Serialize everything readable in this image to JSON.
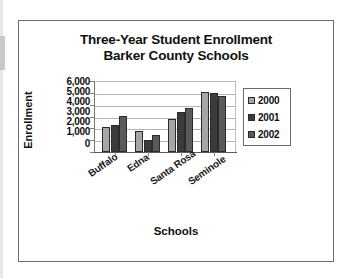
{
  "page": {
    "background": "#ffffff",
    "frame_color": "#6e6e6e"
  },
  "chart_data": {
    "type": "bar",
    "title": "Three-Year Student Enrollment",
    "subtitle": "Barker County Schools",
    "xlabel": "Schools",
    "ylabel": "Enrollment",
    "categories": [
      "Buffalo",
      "Edna",
      "Santa Rosa",
      "Seminole"
    ],
    "series": [
      {
        "name": "2000",
        "color": "#a6a6a6",
        "values": [
          2100,
          1800,
          2800,
          5100
        ]
      },
      {
        "name": "2001",
        "color": "#3b3b3b",
        "values": [
          2250,
          1000,
          3400,
          4950
        ]
      },
      {
        "name": "2002",
        "color": "#5a5a5a",
        "values": [
          3050,
          1450,
          3700,
          4700
        ]
      }
    ],
    "ylim": [
      0,
      6000
    ],
    "yticks": [
      "6,000",
      "5,000",
      "4,000",
      "3,000",
      "2,000",
      "1,000",
      "0"
    ],
    "ytick_values": [
      6000,
      5000,
      4000,
      3000,
      2000,
      1000,
      0
    ],
    "grid": true,
    "legend_position": "right",
    "legend_entries": [
      "2000",
      "2001",
      "2002"
    ]
  }
}
